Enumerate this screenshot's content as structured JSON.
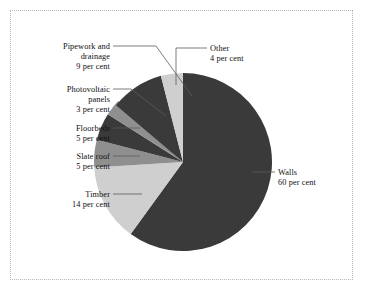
{
  "chart_data": {
    "type": "pie",
    "title": "",
    "subtitle": "",
    "xlabel": "",
    "ylabel": "",
    "legend_position": "none",
    "grid": false,
    "units": "per cent",
    "total": 100,
    "start_angle_deg": 0,
    "direction": "clockwise",
    "categories": [
      "Walls",
      "Timber",
      "Slate roof",
      "Floorbeds",
      "Photovoltaic panels",
      "Pipework and drainage",
      "Other"
    ],
    "values": [
      60,
      14,
      5,
      5,
      3,
      9,
      4
    ],
    "slices": [
      {
        "name": "Walls",
        "value": 60,
        "value_text": "60 per cent",
        "color": "#3a3a3a",
        "label_lines": [
          "Walls",
          "60 per cent"
        ]
      },
      {
        "name": "Timber",
        "value": 14,
        "value_text": "14 per cent",
        "color": "#cfcfcf",
        "label_lines": [
          "Timber",
          "14 per cent"
        ]
      },
      {
        "name": "Slate roof",
        "value": 5,
        "value_text": "5 per cent",
        "color": "#8f8f8f",
        "label_lines": [
          "Slate roof",
          "5 per cent"
        ]
      },
      {
        "name": "Floorbeds",
        "value": 5,
        "value_text": "5 per cent",
        "color": "#3a3a3a",
        "label_lines": [
          "Floorbeds",
          "5 per cent"
        ]
      },
      {
        "name": "Photovoltaic panels",
        "value": 3,
        "value_text": "3 per cent",
        "color": "#8f8f8f",
        "label_lines": [
          "Photovoltaic",
          "panels",
          "3 per cent"
        ]
      },
      {
        "name": "Pipework and drainage",
        "value": 9,
        "value_text": "9 per cent",
        "color": "#3a3a3a",
        "label_lines": [
          "Pipework and",
          "drainage",
          "9 per cent"
        ]
      },
      {
        "name": "Other",
        "value": 4,
        "value_text": "4 per cent",
        "color": "#cfcfcf",
        "label_lines": [
          "Other",
          "4 per cent"
        ]
      }
    ]
  },
  "labels": {
    "pipework": {
      "line1": "Pipework and",
      "line2": "drainage",
      "line3": "9 per cent"
    },
    "photovoltaic": {
      "line1": "Photovoltaic",
      "line2": "panels",
      "line3": "3 per cent"
    },
    "floorbeds": {
      "line1": "Floorbeds",
      "line2": "5 per cent"
    },
    "slate": {
      "line1": "Slate roof",
      "line2": "5 per cent"
    },
    "timber": {
      "line1": "Timber",
      "line2": "14 per cent"
    },
    "other": {
      "line1": "Other",
      "line2": "4 per cent"
    },
    "walls": {
      "line1": "Walls",
      "line2": "60 per cent"
    }
  },
  "colors": {
    "dark": "#3a3a3a",
    "light": "#cfcfcf",
    "medium": "#8f8f8f",
    "leader": "#5a5a5a",
    "frame": "#b9b9b9",
    "background": "#ffffff"
  }
}
